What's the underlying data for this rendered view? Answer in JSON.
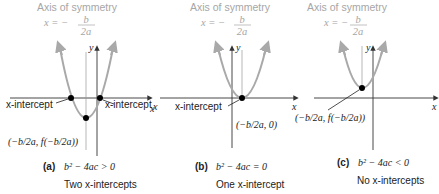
{
  "figure": {
    "panels": [
      {
        "id": "a",
        "axis_title": "Axis of symmetry",
        "axis_eq_lhs": "x = −",
        "axis_eq_num": "b",
        "axis_eq_den": "2a",
        "y_label": "y",
        "x_label": "x",
        "intercept_label_left": "x-intercept",
        "intercept_label_right": "x-intercept",
        "vertex_label": "(−b/2a, f(−b/2a))",
        "caption_letter": "(a)",
        "caption_condition": "b² − 4ac > 0",
        "caption_result": "Two x-intercepts"
      },
      {
        "id": "b",
        "axis_title": "Axis of symmetry",
        "axis_eq_lhs": "x = −",
        "axis_eq_num": "b",
        "axis_eq_den": "2a",
        "y_label": "y",
        "x_label": "x",
        "intercept_label": "x-intercept",
        "vertex_label": "(−b/2a, 0)",
        "caption_letter": "(b)",
        "caption_condition": "b² − 4ac = 0",
        "caption_result": "One x-intercept"
      },
      {
        "id": "c",
        "axis_title": "Axis of symmetry",
        "axis_eq_lhs": "x = −",
        "axis_eq_num": "b",
        "axis_eq_den": "2a",
        "y_label": "y",
        "x_label": "x",
        "vertex_label": "(−b/2a, f(−b/2a))",
        "caption_letter": "(c)",
        "caption_condition": "b² − 4ac < 0",
        "caption_result": "No x-intercepts"
      }
    ],
    "colors": {
      "parabola": "#a9a9a9",
      "axis": "#333333",
      "symmetry_line": "#9a9a9a",
      "point": "#000000",
      "title_text": "#a6a6a6"
    }
  }
}
